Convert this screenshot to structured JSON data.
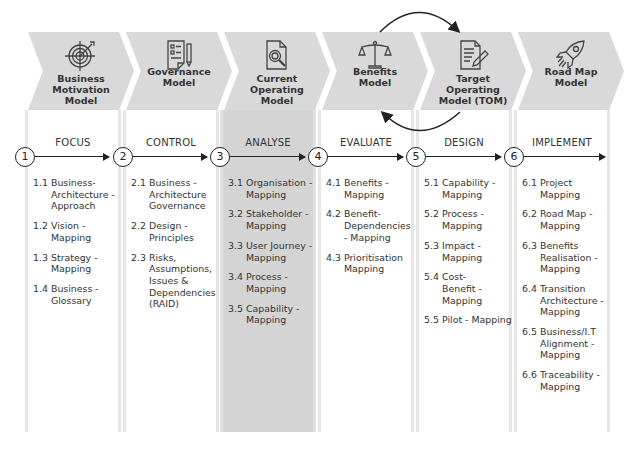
{
  "stages": [
    {
      "number": "1",
      "chevron_title": "Business Motivation Model",
      "icon": "target-icon",
      "label": "FOCUS",
      "items": [
        {
          "num": "1.1",
          "text": "Business-Architecture - Approach"
        },
        {
          "num": "1.2",
          "text": "Vision - Mapping"
        },
        {
          "num": "1.3",
          "text": "Strategy - Mapping"
        },
        {
          "num": "1.4",
          "text": "Business - Glossary"
        }
      ]
    },
    {
      "number": "2",
      "chevron_title": "Governance Model",
      "icon": "document-pen-icon",
      "label": "CONTROL",
      "items": [
        {
          "num": "2.1",
          "text": "Business - Architecture Governance"
        },
        {
          "num": "2.2",
          "text": "Design - Principles"
        },
        {
          "num": "2.3",
          "text": "Risks, Assumptions, Issues & Dependencies (RAID)"
        }
      ]
    },
    {
      "number": "3",
      "chevron_title": "Current Operating Model",
      "icon": "document-search-icon",
      "label": "ANALYSE",
      "highlighted": true,
      "items": [
        {
          "num": "3.1",
          "text": "Organisation - Mapping"
        },
        {
          "num": "3.2",
          "text": "Stakeholder - Mapping"
        },
        {
          "num": "3.3",
          "text": "User Journey - Mapping"
        },
        {
          "num": "3.4",
          "text": "Process - Mapping"
        },
        {
          "num": "3.5",
          "text": "Capability - Mapping"
        }
      ]
    },
    {
      "number": "4",
      "chevron_title": "Benefits Model",
      "icon": "scales-icon",
      "label": "EVALUATE",
      "items": [
        {
          "num": "4.1",
          "text": "Benefits - Mapping"
        },
        {
          "num": "4.2",
          "text": "Benefit-Dependencies - Mapping"
        },
        {
          "num": "4.3",
          "text": "Prioritisation Mapping"
        }
      ]
    },
    {
      "number": "5",
      "chevron_title": "Target Operating Model (TOM)",
      "icon": "document-edit-icon",
      "label": "DESIGN",
      "items": [
        {
          "num": "5.1",
          "text": "Capability - Mapping"
        },
        {
          "num": "5.2",
          "text": "Process - Mapping"
        },
        {
          "num": "5.3",
          "text": "Impact - Mapping"
        },
        {
          "num": "5.4",
          "text": "Cost-Benefit - Mapping"
        },
        {
          "num": "5.5",
          "text": "Pilot - Mapping"
        }
      ]
    },
    {
      "number": "6",
      "chevron_title": "Road Map Model",
      "icon": "rocket-icon",
      "label": "IMPLEMENT",
      "items": [
        {
          "num": "6.1",
          "text": "Project Mapping"
        },
        {
          "num": "6.2",
          "text": "Road Map - Mapping"
        },
        {
          "num": "6.3",
          "text": "Benefits Realisation - Mapping"
        },
        {
          "num": "6.4",
          "text": "Transition Architecture - Mapping"
        },
        {
          "num": "6.5",
          "text": "Business/I.T Alignment - Mapping"
        },
        {
          "num": "6.6",
          "text": "Traceability - Mapping"
        }
      ]
    }
  ],
  "cycle_arrows": {
    "between": [
      "Benefits Model",
      "Target Operating Model (TOM)"
    ],
    "icon": "cycle-arrows-icon"
  },
  "colors": {
    "chevron": "#d9d9d9",
    "highlight_column": "#d4d4d4",
    "column_border": "#e6e6e6",
    "line": "#222222",
    "text": "#333333"
  }
}
